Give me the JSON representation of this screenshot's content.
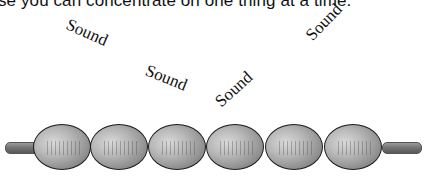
{
  "caption": {
    "text": "se you can concentrate on one thing at a time."
  },
  "labels": [
    {
      "text": "Sound",
      "rotation_deg": 24
    },
    {
      "text": "Sound",
      "rotation_deg": 22
    },
    {
      "text": "Sound",
      "rotation_deg": -42
    },
    {
      "text": "Sound",
      "rotation_deg": -46
    }
  ],
  "chain": {
    "bead_count": 6,
    "bead_color": "#a8a8a8",
    "outline_color": "#1a1a1a",
    "rod_color": "#6e6e6e"
  }
}
